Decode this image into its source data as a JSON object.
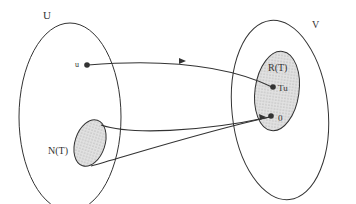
{
  "diagram": {
    "sets": {
      "U": {
        "label": "U"
      },
      "V": {
        "label": "V"
      },
      "kernel": {
        "label": "N(T)"
      },
      "range": {
        "label": "R(T)"
      }
    },
    "points": {
      "u": {
        "label": "u"
      },
      "Tu": {
        "label": "Tu"
      },
      "zero": {
        "label": "0"
      }
    },
    "colors": {
      "stroke": "#333333",
      "fill_shaded": "#d8d8d8",
      "background": "#ffffff"
    }
  }
}
